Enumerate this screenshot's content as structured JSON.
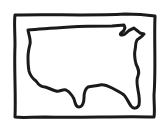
{
  "icon": {
    "label": "United States map",
    "description": "Hand-drawn outline of the contiguous United States inside a rectangular frame",
    "stroke_color": "#1a1a1a",
    "background_color": "#ffffff"
  }
}
